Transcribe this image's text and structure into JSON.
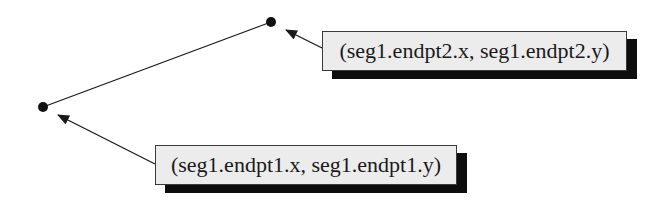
{
  "diagram": {
    "segment": {
      "name": "seg1",
      "endpt1": {
        "x": 43,
        "y": 107
      },
      "endpt2": {
        "x": 271,
        "y": 22
      }
    },
    "labels": {
      "endpt1": "(seg1.endpt1.x, seg1.endpt1.y)",
      "endpt2": "(seg1.endpt2.x, seg1.endpt2.y)"
    },
    "colors": {
      "line": "#1a1a1a",
      "box_fill": "#ececec",
      "shadow": "#0d0d0d"
    }
  }
}
